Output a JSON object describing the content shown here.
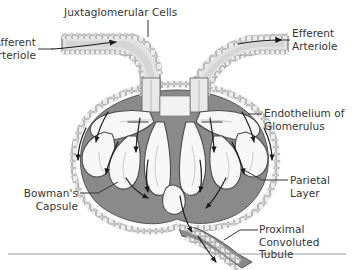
{
  "figure": {
    "colors": {
      "label_text": "#333333",
      "line": "#333333",
      "capsule_space_gray": "#8a8a8a",
      "vessel_lumen_gray": "#d9d9d9",
      "capillary_white": "#f7f7f7",
      "wall_outline": "#555555",
      "background": "#ffffff",
      "bottom_rule": "#999999"
    }
  },
  "labels": {
    "juxtaglomerular_cells": "Juxtaglomerular Cells",
    "afferent_arteriole": "Afferent\nArteriole",
    "efferent_arteriole": "Efferent\nArteriole",
    "endothelium_of_glomerulus": "Endothelium of\nGlomerulus",
    "parietal_layer": "Parietal Layer",
    "bowmans_capsule": "Bowman's\nCapsule",
    "proximal_convoluted_tubule": "Proximal Convoluted\nTubule"
  }
}
